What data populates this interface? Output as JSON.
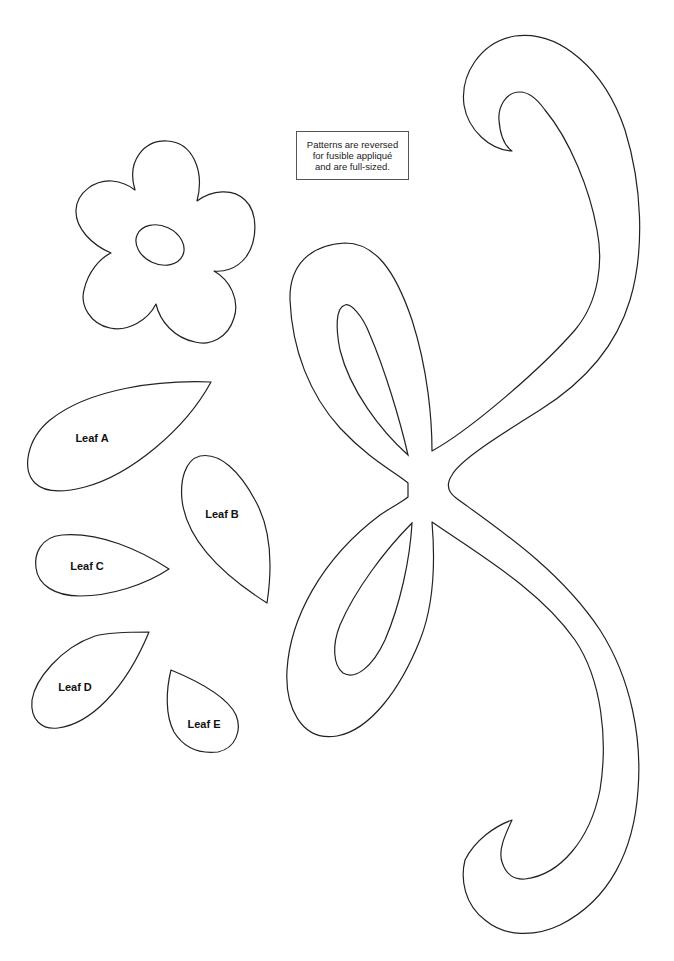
{
  "page": {
    "background": "#ffffff",
    "line_color": "#222222"
  },
  "note": {
    "lines": [
      "Patterns are reversed",
      "for fusible appliqué",
      "and are full-sized."
    ]
  },
  "shapes": {
    "flower": {
      "name": "Flower",
      "petals": 5,
      "has_center_oval": true
    },
    "bow": {
      "name": "Bow with ribbon tails"
    }
  },
  "leaves": [
    {
      "id": "A",
      "label": "Leaf A"
    },
    {
      "id": "B",
      "label": "Leaf B"
    },
    {
      "id": "C",
      "label": "Leaf C"
    },
    {
      "id": "D",
      "label": "Leaf D"
    },
    {
      "id": "E",
      "label": "Leaf E"
    }
  ]
}
